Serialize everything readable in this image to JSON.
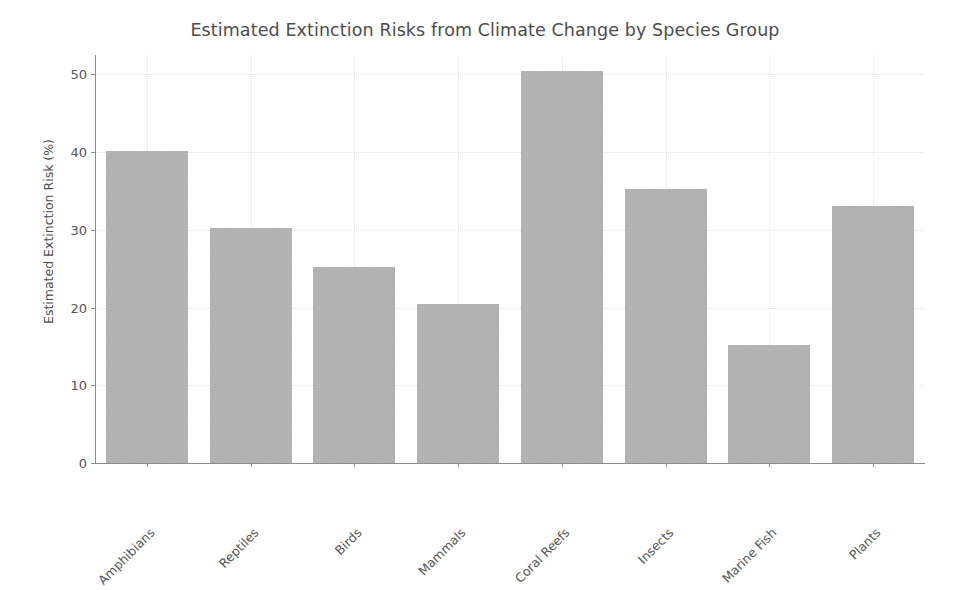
{
  "chart_data": {
    "type": "bar",
    "title": "Estimated Extinction Risks from Climate Change by Species Group",
    "xlabel": "",
    "ylabel": "Estimated Extinction Risk (%)",
    "categories": [
      "Amphibians",
      "Reptiles",
      "Birds",
      "Mammals",
      "Coral Reefs",
      "Insects",
      "Marine Fish",
      "Plants"
    ],
    "values": [
      40.1,
      30.2,
      25.2,
      20.4,
      50.4,
      35.3,
      15.2,
      33.1
    ],
    "ylim": [
      0,
      52.5
    ],
    "yticks": [
      0,
      10,
      20,
      30,
      40,
      50
    ],
    "ytick_labels": [
      "0",
      "10",
      "20",
      "30",
      "40",
      "50"
    ],
    "grid": true,
    "grid_style": "dotted",
    "legend": null,
    "bar_color": "#a9a9a9",
    "grid_color": "#e3e3e3",
    "axis_color": "#8d8d8d",
    "text_color": "#555555",
    "title_color": "#4d4d4d",
    "background": "#ffffff",
    "xtick_rotation": 45
  }
}
